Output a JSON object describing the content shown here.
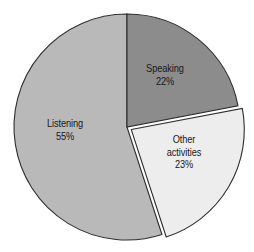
{
  "chart_data": {
    "type": "pie",
    "title": "",
    "subtitle": "",
    "xlabel": "",
    "ylabel": "",
    "legend_position": "none",
    "grid": false,
    "start_angle_deg": 0,
    "direction": "clockwise",
    "categories": [
      "Speaking",
      "Other activities",
      "Listening"
    ],
    "values": [
      22,
      23,
      55
    ],
    "value_unit": "%",
    "slices": [
      {
        "name": "Speaking",
        "label_lines": [
          "Speaking",
          "22%"
        ],
        "value": 22,
        "value_label": "22%",
        "color": "#8c8c8c",
        "start_deg": 0,
        "end_deg": 79.2,
        "exploded": false
      },
      {
        "name": "Other activities",
        "label_lines": [
          "Other",
          "activities",
          "23%"
        ],
        "value": 23,
        "value_label": "23%",
        "color": "#ededed",
        "start_deg": 79.2,
        "end_deg": 162.0,
        "exploded": true
      },
      {
        "name": "Listening",
        "label_lines": [
          "Listening",
          "55%"
        ],
        "value": 55,
        "value_label": "55%",
        "color": "#b9b9b9",
        "start_deg": 162.0,
        "end_deg": 360.0,
        "exploded": false
      }
    ]
  },
  "geometry": {
    "center_x": 127,
    "center_y": 127,
    "radius": 113,
    "explode_offset": 5
  },
  "style": {
    "background": "#ffffff",
    "outline": "#2e2e2e",
    "text": "#181818"
  }
}
